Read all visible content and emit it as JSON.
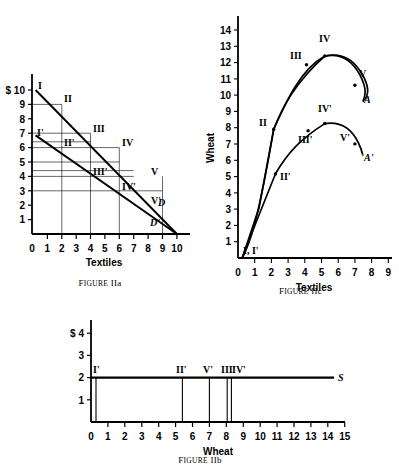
{
  "page": {
    "background": "#ffffff",
    "ink": "#000000",
    "width": 399,
    "height": 472
  },
  "figures": [
    {
      "id": "IIa",
      "caption_prefix": "F",
      "caption_smallcaps": "IGURE",
      "caption_label": "IIa",
      "caption_full": "FIGURE IIa",
      "x_axis": {
        "title": "Textiles",
        "ticks": [
          "0",
          "1",
          "2",
          "3",
          "4",
          "5",
          "6",
          "7",
          "8",
          "9",
          "10"
        ],
        "min": 0,
        "max": 10
      },
      "y_axis": {
        "title": "",
        "ticks": [
          "1",
          "2",
          "3",
          "4",
          "5",
          "6",
          "7",
          "8",
          "9",
          "$ 10"
        ],
        "tick_values": [
          1,
          2,
          3,
          4,
          5,
          6,
          7,
          8,
          9,
          10
        ],
        "min": 0,
        "max": 10.8
      },
      "curves": [
        {
          "name": "D",
          "label": "D",
          "type": "line",
          "points": [
            [
              0.25,
              10.0
            ],
            [
              10.0,
              0.0
            ]
          ]
        },
        {
          "name": "D-prime",
          "label": "D'",
          "type": "line",
          "points": [
            [
              0.25,
              6.85
            ],
            [
              10.0,
              0.0
            ]
          ]
        }
      ],
      "point_labels": [
        {
          "text": "I",
          "x": 0.45,
          "y": 10.5
        },
        {
          "text": "II",
          "x": 2.25,
          "y": 8.55
        },
        {
          "text": "III",
          "x": 4.3,
          "y": 6.45
        },
        {
          "text": "IV",
          "x": 5.35,
          "y": 5.45
        },
        {
          "text": "V",
          "x": 7.4,
          "y": 3.4
        },
        {
          "text": "I'",
          "x": 0.55,
          "y": 7.0
        },
        {
          "text": "II'",
          "x": 2.25,
          "y": 5.75
        },
        {
          "text": "III'",
          "x": 4.3,
          "y": 4.15
        },
        {
          "text": "IV'",
          "x": 5.35,
          "y": 3.55
        },
        {
          "text": "V'",
          "x": 7.1,
          "y": 2.1
        },
        {
          "text": "D",
          "x": 8.5,
          "y": 2.0
        },
        {
          "text": "D'",
          "x": 8.2,
          "y": 1.0
        }
      ],
      "guide_lines_v": [
        2,
        4,
        5,
        7
      ],
      "guide_lines_h": [
        8,
        6,
        5.4,
        5,
        4,
        3.4,
        3,
        2
      ]
    },
    {
      "id": "IIc",
      "caption_full": "FIGURE IIc",
      "caption_prefix": "F",
      "caption_smallcaps": "IGURE",
      "caption_label": "IIc",
      "x_axis": {
        "title": "Textiles",
        "ticks": [
          "0",
          "1",
          "2",
          "3",
          "4",
          "5",
          "6",
          "7",
          "8",
          "9"
        ],
        "min": 0,
        "max": 9
      },
      "y_axis": {
        "title": "Wheat",
        "ticks": [
          "1",
          "2",
          "3",
          "4",
          "5",
          "6",
          "7",
          "8",
          "9",
          "10",
          "11",
          "12",
          "13",
          "14"
        ],
        "min": 0,
        "max": 14
      },
      "curves": [
        {
          "name": "A",
          "label": "A",
          "type": "curve",
          "points": [
            [
              0.25,
              0.0
            ],
            [
              1.0,
              3.4
            ],
            [
              2.1,
              7.9
            ],
            [
              3.0,
              10.1
            ],
            [
              4.1,
              11.85
            ],
            [
              5.2,
              12.4
            ],
            [
              6.0,
              12.0
            ],
            [
              7.0,
              10.6
            ],
            [
              7.4,
              9.8
            ]
          ]
        },
        {
          "name": "A-prime",
          "label": "A'",
          "type": "curve",
          "points": [
            [
              0.25,
              0.0
            ],
            [
              1.0,
              2.2
            ],
            [
              2.2,
              5.15
            ],
            [
              3.2,
              6.8
            ],
            [
              4.2,
              7.8
            ],
            [
              5.2,
              8.25
            ],
            [
              6.0,
              8.0
            ],
            [
              7.0,
              7.0
            ],
            [
              7.45,
              6.3
            ]
          ]
        }
      ],
      "point_markers": [
        {
          "curve": "A",
          "x": 2.1,
          "y": 7.9,
          "label": "II",
          "lx": 1.55,
          "ly": 8.3
        },
        {
          "curve": "A",
          "x": 4.1,
          "y": 11.85,
          "label": "III",
          "lx": 3.55,
          "ly": 12.55
        },
        {
          "curve": "A",
          "x": 5.2,
          "y": 12.4,
          "label": "IV",
          "lx": 5.1,
          "ly": 13.25
        },
        {
          "curve": "A",
          "x": 7.0,
          "y": 10.6,
          "label": "V",
          "lx": 7.35,
          "ly": 11.2
        },
        {
          "curve": "A-prime",
          "x": 2.2,
          "y": 5.15,
          "label": "II'",
          "lx": 2.5,
          "ly": 5.1
        },
        {
          "curve": "A-prime",
          "x": 4.2,
          "y": 7.8,
          "label": "III'",
          "lx": 4.15,
          "ly": 7.2
        },
        {
          "curve": "A-prime",
          "x": 5.2,
          "y": 8.25,
          "label": "IV'",
          "lx": 5.1,
          "ly": 9.0
        },
        {
          "curve": "A-prime",
          "x": 7.0,
          "y": 7.0,
          "label": "V'",
          "lx": 6.6,
          "ly": 6.9
        }
      ],
      "origin_label": "I, I'",
      "endpoint_labels": [
        {
          "text": "A",
          "x": 7.7,
          "y": 9.6
        },
        {
          "text": "A'",
          "x": 7.75,
          "y": 6.1
        }
      ]
    },
    {
      "id": "IIb",
      "caption_full": "FIGURE IIb",
      "caption_prefix": "F",
      "caption_smallcaps": "IGURE",
      "caption_label": "IIb",
      "x_axis": {
        "title": "Wheat",
        "ticks": [
          "0",
          "1",
          "2",
          "3",
          "4",
          "5",
          "6",
          "7",
          "8",
          "9",
          "10",
          "11",
          "12",
          "13",
          "14",
          "15"
        ],
        "min": 0,
        "max": 15
      },
      "y_axis": {
        "title": "",
        "ticks": [
          "1",
          "2",
          "3",
          "$ 4"
        ],
        "tick_values": [
          1,
          2,
          3,
          4
        ],
        "min": 0,
        "max": 4.6
      },
      "supply_line": {
        "label": "S",
        "price": 2,
        "x_start": 0,
        "x_end": 14.4
      },
      "verticals": [
        {
          "label": "I'",
          "x": 0.3,
          "label_x": 0.25
        },
        {
          "label": "II'",
          "x": 5.4,
          "label_x": 5.35
        },
        {
          "label": "V'",
          "x": 7.0,
          "label_x": 6.95
        },
        {
          "label": "III'",
          "x": 8.05,
          "label_x": 7.95
        },
        {
          "label": "IV'",
          "x": 8.3,
          "label_x": 8.4
        }
      ]
    }
  ]
}
